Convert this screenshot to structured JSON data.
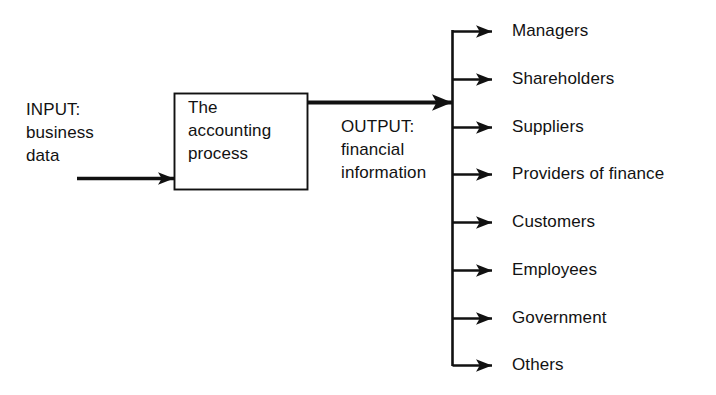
{
  "diagram": {
    "title": "The accounting process",
    "background_color": "#ffffff",
    "line_color": "#111111",
    "text_color": "#121212",
    "input": {
      "label_lines": [
        "INPUT:",
        "business",
        "data"
      ],
      "text": "INPUT:\nbusiness\ndata",
      "arrow_name": "input-arrow"
    },
    "process": {
      "label_lines": [
        "The",
        "accounting",
        "process"
      ],
      "text": "The\naccounting\nprocess",
      "box_name": "accounting-process-box"
    },
    "output": {
      "label_lines": [
        "OUTPUT:",
        "financial",
        "information"
      ],
      "text": "OUTPUT:\nfinancial\ninformation",
      "arrow_name": "output-arrow"
    },
    "recipients": [
      {
        "label": "Managers",
        "y": 31
      },
      {
        "label": "Shareholders",
        "y": 79
      },
      {
        "label": "Suppliers",
        "y": 127
      },
      {
        "label": "Providers of finance",
        "y": 174
      },
      {
        "label": "Customers",
        "y": 222
      },
      {
        "label": "Employees",
        "y": 270
      },
      {
        "label": "Government",
        "y": 318
      },
      {
        "label": "Others",
        "y": 365
      }
    ]
  }
}
